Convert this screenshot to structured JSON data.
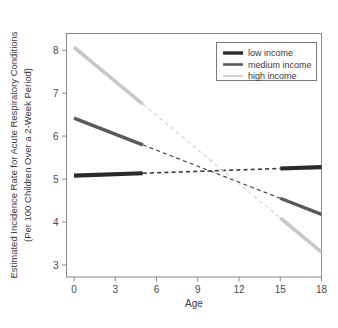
{
  "chart_data": {
    "type": "line",
    "title": "",
    "xlabel": "Age",
    "ylabel": "Estimated Incidence Rate for Acute Respiratory Conditions (Per 100 Children Over a 2-Week Period)",
    "ylabel_line1": "Estimated Incidence Rate for Acute Respiratory Conditions",
    "ylabel_line2": "(Per 100 Children Over a 2-Week Period)",
    "xlim": [
      0,
      18
    ],
    "ylim": [
      2.72,
      8.39
    ],
    "xticks": [
      0,
      3,
      6,
      9,
      12,
      15,
      18
    ],
    "xticklabels": [
      "0",
      "3",
      "6",
      "9",
      "12",
      "15",
      "18"
    ],
    "yticks": [
      3,
      4,
      5,
      6,
      7,
      8
    ],
    "yticklabels": [
      "3",
      "4",
      "5",
      "6",
      "7",
      "8"
    ],
    "grid": false,
    "legend_position": "top-right",
    "solid_ranges": [
      [
        0,
        5
      ],
      [
        15,
        18
      ]
    ],
    "dashed_range": [
      5,
      15
    ],
    "crossing_point": {
      "x": 9,
      "y": 5.15
    },
    "series": [
      {
        "name": "low income",
        "color": "#2a2a2a",
        "x": [
          0,
          18
        ],
        "values": [
          5.08,
          5.28
        ],
        "y_at_ticks": {
          "0": 5.08,
          "3": 5.11,
          "5": 5.13,
          "9": 5.16,
          "15": 5.25,
          "18": 5.28
        }
      },
      {
        "name": "medium income",
        "color": "#595959",
        "x": [
          0,
          18
        ],
        "values": [
          6.42,
          4.18
        ],
        "y_at_ticks": {
          "0": 6.42,
          "3": 6.05,
          "5": 5.7,
          "9": 5.15,
          "15": 4.53,
          "18": 4.18
        }
      },
      {
        "name": "high income",
        "color": "#c8c8c8",
        "x": [
          0,
          18
        ],
        "values": [
          8.07,
          3.3
        ],
        "y_at_ticks": {
          "0": 8.07,
          "3": 6.99,
          "5": 6.34,
          "9": 5.12,
          "15": 3.94,
          "18": 3.3
        }
      }
    ]
  },
  "legend": {
    "entries": [
      {
        "label": "low income",
        "color": "#2a2a2a",
        "width": 3.4
      },
      {
        "label": "medium income",
        "color": "#595959",
        "width": 2.6
      },
      {
        "label": "high income",
        "color": "#c8c8c8",
        "width": 1.6
      }
    ]
  },
  "colors": {
    "background": "#ffffff",
    "frame": "#8a8a8a",
    "text": "#3a3a3a",
    "low_income": "#2a2a2a",
    "medium_income": "#595959",
    "high_income": "#c8c8c8"
  }
}
